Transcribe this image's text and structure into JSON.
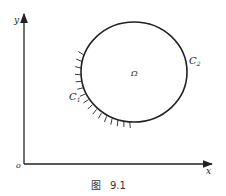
{
  "figure": {
    "caption_prefix": "图",
    "caption_number": "9.1"
  },
  "axes": {
    "x_label": "x",
    "y_label": "y",
    "origin_label": "o"
  },
  "region": {
    "label": "Ω"
  },
  "boundary": {
    "c1_label": "C",
    "c1_sub": "1",
    "c2_label": "C",
    "c2_sub": "2",
    "c1_style": "hatched (fixed boundary)",
    "c2_style": "plain"
  },
  "colors": {
    "ink": "#222222",
    "background": "#ffffff"
  }
}
